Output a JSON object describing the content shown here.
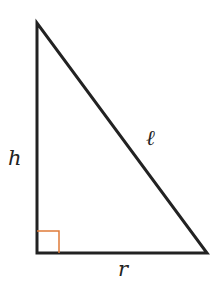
{
  "diagram": {
    "type": "right-triangle",
    "labels": {
      "height": "h",
      "slant": "ℓ",
      "base": "r"
    },
    "colors": {
      "stroke": "#222222",
      "right_angle_marker": "#e07b39",
      "background": "#ffffff"
    }
  }
}
